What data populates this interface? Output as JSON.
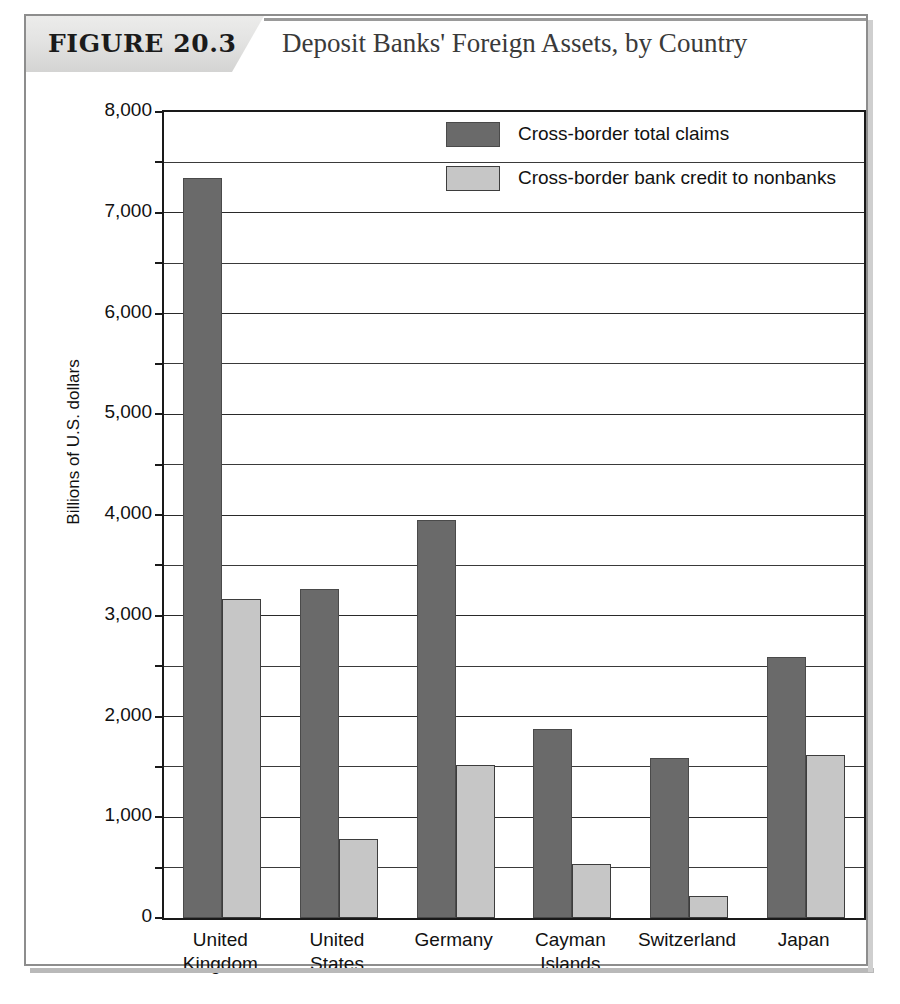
{
  "figure": {
    "number_label": "FIGURE 20.3",
    "title": "Deposit Banks' Foreign Assets, by Country"
  },
  "chart_data": {
    "type": "bar",
    "title": "Deposit Banks' Foreign Assets, by Country",
    "xlabel": "",
    "ylabel": "Billions of U.S. dollars",
    "ylim": [
      0,
      8000
    ],
    "ytick_labels": [
      "0",
      "1,000",
      "2,000",
      "3,000",
      "4,000",
      "5,000",
      "6,000",
      "7,000",
      "8,000"
    ],
    "ytick_values": [
      0,
      1000,
      2000,
      3000,
      4000,
      5000,
      6000,
      7000,
      8000
    ],
    "minor_tick_step": 500,
    "grid": true,
    "legend_position": "upper-center",
    "categories": [
      "United Kingdom",
      "United States",
      "Germany",
      "Cayman Islands",
      "Switzerland",
      "Japan"
    ],
    "category_lines": [
      [
        "United",
        "Kingdom"
      ],
      [
        "United",
        "States"
      ],
      [
        "Germany",
        ""
      ],
      [
        "Cayman",
        "Islands"
      ],
      [
        "Switzerland",
        ""
      ],
      [
        "Japan",
        ""
      ]
    ],
    "series": [
      {
        "name": "Cross-border total claims",
        "color": "#6a6a6a",
        "values": [
          7350,
          3270,
          3950,
          1880,
          1590,
          2590
        ]
      },
      {
        "name": "Cross-border bank credit to nonbanks",
        "color": "#c6c6c6",
        "values": [
          3170,
          780,
          1520,
          540,
          215,
          1620
        ]
      }
    ]
  },
  "colors": {
    "total_claims": "#6a6a6a",
    "nonbank_credit": "#c6c6c6",
    "axis": "#1a1a1a",
    "frame": "#8d8d8d"
  }
}
